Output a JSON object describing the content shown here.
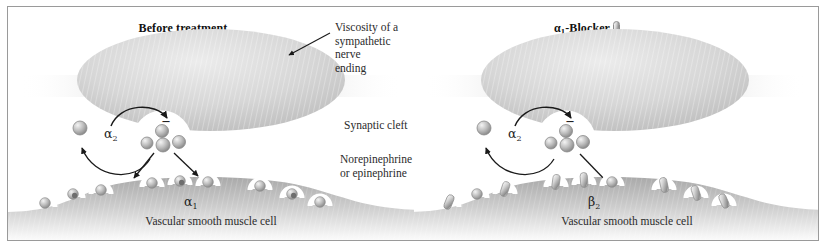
{
  "figure": {
    "kind": "medical-illustration",
    "title_left": "Before treatment",
    "title_right_main": "-Blocker",
    "title_right_prefix_greek": "α",
    "title_right_prefix_sub": "1",
    "border_color": "#9a9a9a",
    "background": "#ffffff"
  },
  "panels": [
    {
      "id": "before-treatment",
      "title": "Before treatment",
      "nerve_label": "α",
      "nerve_label_sub": "2",
      "membrane_label": "α",
      "membrane_label_sub": "1",
      "caption": "Vascular smooth muscle cell",
      "callouts": [
        {
          "name": "vicinity",
          "text": "Viscosity of a\nsympathetic nerve\nending"
        },
        {
          "name": "synaptic-cleft",
          "text": "Synaptic cleft"
        },
        {
          "name": "neurotransmitter",
          "text": "Norepinephrine\nor epinephrine"
        }
      ],
      "receptors": [
        {
          "x": 35,
          "y": 192,
          "occupied_by": "norepinephrine"
        },
        {
          "x": 65,
          "y": 183,
          "occupied_by": "norepinephrine"
        },
        {
          "x": 93,
          "y": 179,
          "occupied_by": "norepinephrine"
        },
        {
          "x": 144,
          "y": 172,
          "occupied_by": "norepinephrine"
        },
        {
          "x": 172,
          "y": 170,
          "occupied_by": "norepinephrine"
        },
        {
          "x": 200,
          "y": 171,
          "occupied_by": "norepinephrine"
        },
        {
          "x": 252,
          "y": 175,
          "occupied_by": "norepinephrine"
        },
        {
          "x": 284,
          "y": 183,
          "occupied_by": "norepinephrine"
        },
        {
          "x": 312,
          "y": 191,
          "occupied_by": "norepinephrine"
        }
      ],
      "vesicle_count": 4,
      "reuptake_sphere": true,
      "minus_sign": "–"
    },
    {
      "id": "alpha1-blocker",
      "title_greek": "α",
      "title_sub": "1",
      "title_rest": "-Blocker",
      "nerve_label": "α",
      "nerve_label_sub": "2",
      "membrane_label": "β",
      "membrane_label_sub": "2",
      "caption": "Vascular smooth muscle cell",
      "receptors": [
        {
          "x": 35,
          "y": 192,
          "occupied_by": "blocker"
        },
        {
          "x": 65,
          "y": 183,
          "occupied_by": "norepinephrine"
        },
        {
          "x": 93,
          "y": 179,
          "occupied_by": "blocker"
        },
        {
          "x": 144,
          "y": 172,
          "occupied_by": "blocker"
        },
        {
          "x": 172,
          "y": 170,
          "occupied_by": "blocker"
        },
        {
          "x": 200,
          "y": 171,
          "occupied_by": "norepinephrine"
        },
        {
          "x": 252,
          "y": 175,
          "occupied_by": "blocker"
        },
        {
          "x": 284,
          "y": 183,
          "occupied_by": "blocker"
        },
        {
          "x": 312,
          "y": 191,
          "occupied_by": "blocker"
        }
      ],
      "vesicle_count": 4,
      "reuptake_sphere": true,
      "minus_sign": "–"
    }
  ],
  "colors": {
    "nerve_fill_light": "#e4e4e4",
    "nerve_fill_dark": "#bdbdbd",
    "muscle_fill_dark": "#b0b0b0",
    "muscle_fill_light": "#ffffff",
    "sphere_light": "#e8e8e8",
    "sphere_dark": "#7c7c7c",
    "capsule_dark": "#8d8d8d",
    "arrow": "#1a1a1a",
    "text": "#2b2b2b"
  }
}
